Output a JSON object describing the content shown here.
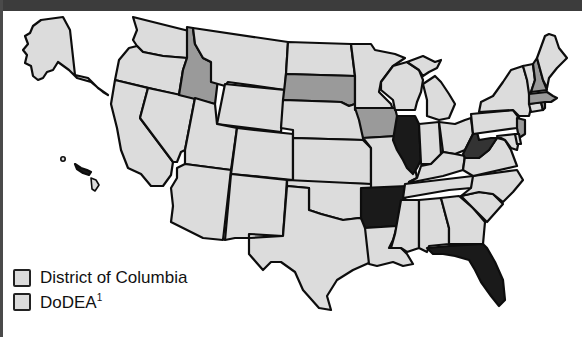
{
  "title": "",
  "colors": {
    "none": "#dcdcdc",
    "medium": "#9a9a9a",
    "dark": "#1a1a1a",
    "darker_gray": "#333333",
    "outline": "#0d0d0d",
    "title_bar": "#3c3c3c"
  },
  "map": {
    "region": "United States",
    "states_medium_shade": [
      "Idaho",
      "South Dakota",
      "Iowa",
      "New Hampshire",
      "Massachusetts",
      "Rhode Island",
      "New Jersey"
    ],
    "states_dark_shade": [
      "Illinois",
      "Arkansas",
      "Florida",
      "West Virginia"
    ],
    "states_unshaded": "all other states including Alaska and Hawaii"
  },
  "legend": {
    "items": [
      {
        "label": "District of Columbia",
        "swatch": "#dcdcdc"
      },
      {
        "label": "DoDEA",
        "superscript": "1",
        "swatch": "#dcdcdc"
      }
    ]
  }
}
